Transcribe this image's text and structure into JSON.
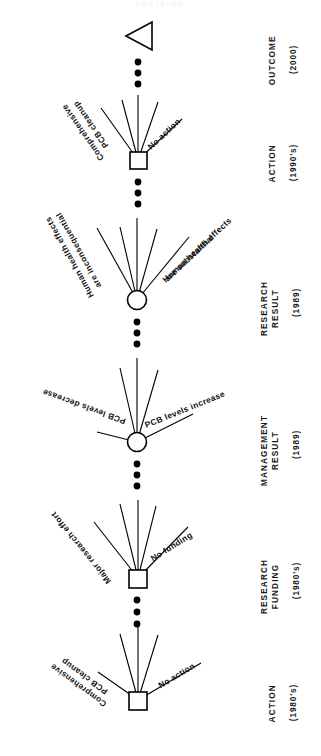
{
  "diagram": {
    "type": "decision-tree",
    "title_faint": "DECISION",
    "orientation": "rotated-90-counterclockwise",
    "node_types": {
      "square": "decision-node",
      "circle": "chance-node",
      "triangle": "terminal-value-node"
    },
    "stages": [
      {
        "id": "outcome",
        "name": "OUTCOME",
        "period": "(2000)",
        "node": "triangle",
        "branches": []
      },
      {
        "id": "action-1990s",
        "name": "ACTION",
        "period": "(1990's)",
        "node": "square",
        "branches": [
          {
            "id": "comprehensive-pcb-cleanup",
            "label_line1": "Comprehensive",
            "label_line2": "PCB cleanup",
            "side": "upper"
          },
          {
            "id": "no-action",
            "label_line1": "No action",
            "label_line2": "",
            "side": "lower"
          }
        ]
      },
      {
        "id": "research-result",
        "name": "RESEARCH\nRESULT",
        "period": "(1989)",
        "node": "circle",
        "branches": [
          {
            "id": "health-effects-inconsequential",
            "label_line1": "Human health effects",
            "label_line2": "are inconsequential",
            "side": "upper"
          },
          {
            "id": "health-effects-substantial",
            "label_line1": "Human health effects",
            "label_line2": "are substantial",
            "side": "lower"
          }
        ]
      },
      {
        "id": "management-result",
        "name": "MANAGEMENT\nRESULT",
        "period": "(1989)",
        "node": "circle",
        "branches": [
          {
            "id": "pcb-levels-decrease",
            "label_line1": "PCB levels decrease",
            "label_line2": "",
            "side": "upper"
          },
          {
            "id": "pcb-levels-increase",
            "label_line1": "PCB levels increase",
            "label_line2": "",
            "side": "lower"
          }
        ]
      },
      {
        "id": "research-funding",
        "name": "RESEARCH\nFUNDING",
        "period": "(1980's)",
        "node": "square",
        "branches": [
          {
            "id": "major-research-effort",
            "label_line1": "Major research effort",
            "label_line2": "",
            "side": "upper"
          },
          {
            "id": "no-funding",
            "label_line1": "No funding",
            "label_line2": "",
            "side": "lower"
          }
        ]
      },
      {
        "id": "action-1980s",
        "name": "ACTION",
        "period": "(1980's)",
        "node": "square",
        "branches": [
          {
            "id": "comprehensive-pcb-cleanup",
            "label_line1": "Comprehensive",
            "label_line2": "PCB cleanup",
            "side": "upper"
          },
          {
            "id": "no-action",
            "label_line1": "No action",
            "label_line2": "",
            "side": "lower"
          }
        ]
      }
    ],
    "colors": {
      "stroke": "#000000",
      "fill": "#ffffff",
      "text": "#111111",
      "background": "#ffffff"
    },
    "ellipsis_symbol": "•••"
  }
}
